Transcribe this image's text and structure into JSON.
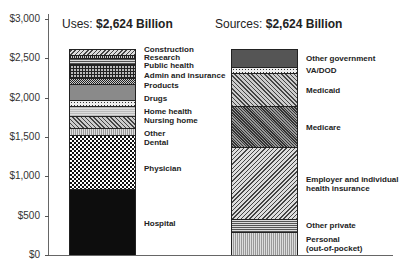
{
  "chart_data": [
    {
      "type": "bar",
      "stacked": true,
      "title": "Uses: $2,624 Billion",
      "title_prefix": "Uses: ",
      "title_value": "$2,624 Billion",
      "ylabel": "",
      "xlabel": "",
      "ylim": [
        0,
        3000
      ],
      "yticks": [
        "$0",
        "$500",
        "$1,000",
        "$1,500",
        "$2,000",
        "$2,500",
        "$3,000"
      ],
      "grid": false,
      "series": [
        {
          "name": "Hospital",
          "value": 837,
          "pattern": "p-solid-black"
        },
        {
          "name": "Physician",
          "value": 688,
          "pattern": "p-check"
        },
        {
          "name": "Dental",
          "value": 90,
          "pattern": "p-vlines-light"
        },
        {
          "name": "Other",
          "value": 150,
          "pattern": "p-diag"
        },
        {
          "name": "Nursing home",
          "value": 127,
          "pattern": "p-gray-light"
        },
        {
          "name": "Home health",
          "value": 76,
          "pattern": "p-dots"
        },
        {
          "name": "Drugs",
          "value": 203,
          "pattern": "p-gray-mid"
        },
        {
          "name": "Products",
          "value": 76,
          "pattern": "p-cross"
        },
        {
          "name": "Admin and insurance",
          "value": 178,
          "pattern": "p-grid"
        },
        {
          "name": "Public health",
          "value": 76,
          "pattern": "p-hlines"
        },
        {
          "name": "Research",
          "value": 38,
          "pattern": "p-vlines"
        },
        {
          "name": "Construction",
          "value": 85,
          "pattern": "p-diag-fine"
        }
      ]
    },
    {
      "type": "bar",
      "stacked": true,
      "title": "Sources: $2,624 Billion",
      "title_prefix": "Sources: ",
      "title_value": "$2,624 Billion",
      "ylim": [
        0,
        3000
      ],
      "series": [
        {
          "name": "Personal (out-of-pocket)",
          "value": 292,
          "pattern": "p-vlines-light"
        },
        {
          "name": "Other private",
          "value": 165,
          "pattern": "p-hlines"
        },
        {
          "name": "Employer and individual health insurance",
          "value": 915,
          "pattern": "p-diag-fine"
        },
        {
          "name": "Medicare",
          "value": 521,
          "pattern": "p-diag-dark"
        },
        {
          "name": "Medicaid",
          "value": 419,
          "pattern": "p-diag"
        },
        {
          "name": "VA/DOD",
          "value": 76,
          "pattern": "p-dots"
        },
        {
          "name": "Other government",
          "value": 236,
          "pattern": "p-dark-gray"
        }
      ]
    }
  ],
  "labels": {
    "uses": {
      "hospital": "Hospital",
      "physician": "Physician",
      "dental": "Dental",
      "other": "Other",
      "nursing_home": "Nursing home",
      "home_health": "Home health",
      "drugs": "Drugs",
      "products": "Products",
      "admin": "Admin and insurance",
      "public_health": "Public health",
      "research": "Research",
      "construction": "Construction"
    },
    "sources": {
      "personal_1": "Personal",
      "personal_2": "(out-of-pocket)",
      "other_private": "Other private",
      "employer_1": "Employer and individual",
      "employer_2": "health insurance",
      "medicare": "Medicare",
      "medicaid": "Medicaid",
      "vadod": "VA/DOD",
      "other_gov": "Other government"
    }
  }
}
